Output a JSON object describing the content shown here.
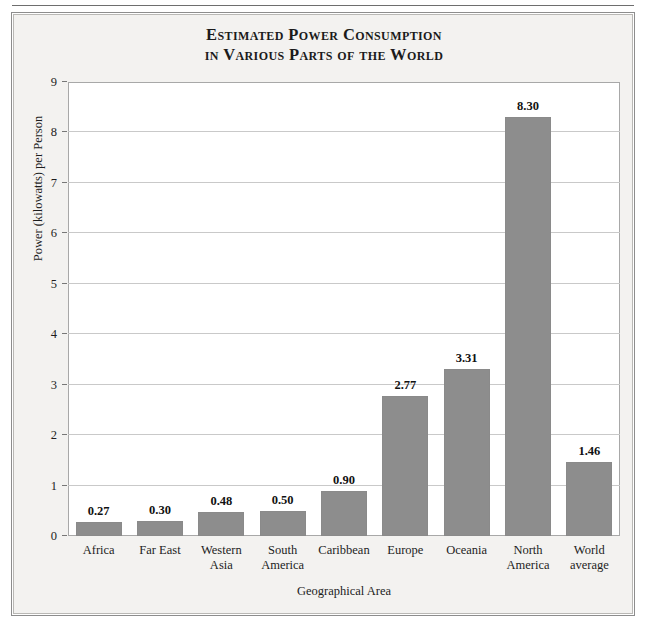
{
  "figure": {
    "title_line1": "Estimated Power Consumption",
    "title_line2": "in Various Parts of the World"
  },
  "chart_data": {
    "type": "bar",
    "title": "Estimated Power Consumption in Various Parts of the World",
    "xlabel": "Geographical Area",
    "ylabel": "Power (kilowatts) per Person",
    "categories": [
      "Africa",
      "Far East",
      "Western Asia",
      "South America",
      "Caribbean",
      "Europe",
      "Oceania",
      "North America",
      "World average"
    ],
    "category_lines": [
      [
        "Africa"
      ],
      [
        "Far East"
      ],
      [
        "Western",
        "Asia"
      ],
      [
        "South",
        "America"
      ],
      [
        "Caribbean"
      ],
      [
        "Europe"
      ],
      [
        "Oceania"
      ],
      [
        "North",
        "America"
      ],
      [
        "World",
        "average"
      ]
    ],
    "values": [
      0.27,
      0.3,
      0.48,
      0.5,
      0.9,
      2.77,
      3.31,
      8.3,
      1.46
    ],
    "value_labels": [
      "0.27",
      "0.30",
      "0.48",
      "0.50",
      "0.90",
      "2.77",
      "3.31",
      "8.30",
      "1.46"
    ],
    "ylim": [
      0,
      9
    ],
    "yticks": [
      0,
      1,
      2,
      3,
      4,
      5,
      6,
      7,
      8,
      9
    ],
    "ytick_labels": [
      "0",
      "1",
      "2",
      "3",
      "4",
      "5",
      "6",
      "7",
      "8",
      "9"
    ],
    "grid": true,
    "legend": false,
    "bar_color": "#8d8d8d",
    "plot_background": "#ffffff",
    "figure_background": "#f3f2f0"
  }
}
